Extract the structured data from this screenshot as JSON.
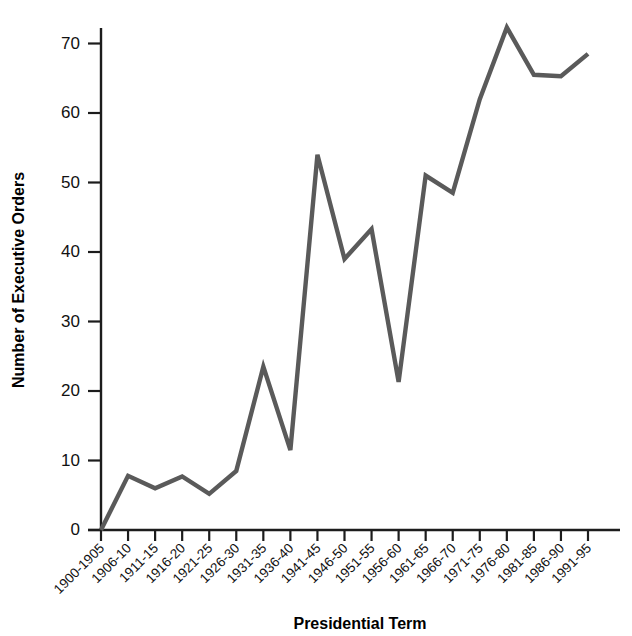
{
  "chart_data": {
    "type": "line",
    "title": "",
    "xlabel": "Presidential Term",
    "ylabel": "Number of Executive Orders",
    "categories": [
      "1900-1905",
      "1906-10",
      "1911-15",
      "1916-20",
      "1921-25",
      "1926-30",
      "1931-35",
      "1936-40",
      "1941-45",
      "1946-50",
      "1951-55",
      "1956-60",
      "1961-65",
      "1966-70",
      "1971-75",
      "1976-80",
      "1981-85",
      "1986-90",
      "1991-95"
    ],
    "values": [
      0,
      7.8,
      6.0,
      7.7,
      5.2,
      8.5,
      23.5,
      11.5,
      54.0,
      39.0,
      43.3,
      21.3,
      51.0,
      48.5,
      62.0,
      72.3,
      65.5,
      65.3,
      68.5
    ],
    "ylim": [
      0,
      74
    ],
    "yticks": [
      0,
      10,
      20,
      30,
      40,
      50,
      60,
      70
    ],
    "ytick_labels": [
      "0",
      "10",
      "20",
      "30",
      "40",
      "50",
      "60",
      "70"
    ],
    "grid": false,
    "legend": null,
    "series_color": "#5a5a5a",
    "axis_color": "#1c1c1c"
  },
  "axes": {
    "y_title": "Number of Executive Orders",
    "x_title": "Presidential Term"
  }
}
